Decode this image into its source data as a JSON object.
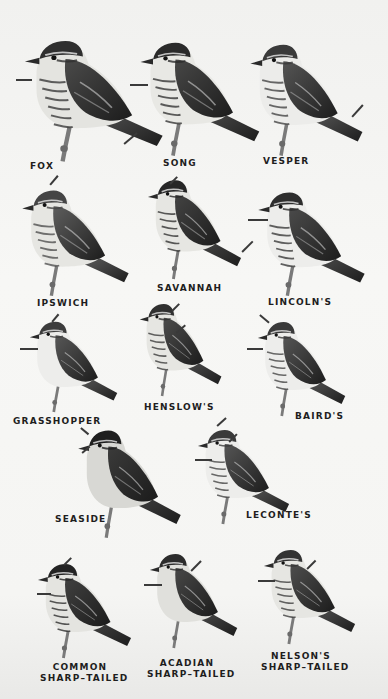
{
  "plate": {
    "background": "#f3f3f1",
    "ink": "#1e1e1e"
  },
  "birds": [
    {
      "id": "fox",
      "label": "FOX",
      "label_lines": [
        "FOX"
      ],
      "x": 22,
      "y": 36,
      "w": 145,
      "h": 128,
      "shade": "#2f2f2f",
      "belly": "#e4e4e0",
      "streaked": true
    },
    {
      "id": "song",
      "label": "SONG",
      "label_lines": [
        "SONG"
      ],
      "x": 138,
      "y": 38,
      "w": 125,
      "h": 120,
      "shade": "#2a2a2a",
      "belly": "#e8e8e4",
      "streaked": true
    },
    {
      "id": "vesper",
      "label": "VESPER",
      "label_lines": [
        "VESPER"
      ],
      "x": 248,
      "y": 40,
      "w": 118,
      "h": 118,
      "shade": "#3a3a3a",
      "belly": "#ececea",
      "streaked": true
    },
    {
      "id": "ipswich",
      "label": "IPSWICH",
      "label_lines": [
        "IPSWICH"
      ],
      "x": 20,
      "y": 186,
      "w": 112,
      "h": 112,
      "shade": "#454545",
      "belly": "#e6e6e2",
      "streaked": true
    },
    {
      "id": "savannah",
      "label": "SAVANNAH",
      "label_lines": [
        "SAVANNAH"
      ],
      "x": 146,
      "y": 176,
      "w": 98,
      "h": 105,
      "shade": "#262626",
      "belly": "#e6e6e2",
      "streaked": true
    },
    {
      "id": "lincolns",
      "label": "LINCOLN'S",
      "label_lines": [
        "LINCOLN'S"
      ],
      "x": 256,
      "y": 188,
      "w": 112,
      "h": 110,
      "shade": "#2e2e2e",
      "belly": "#ededeb",
      "streaked": true
    },
    {
      "id": "grasshopper",
      "label": "GRASSHOPPER",
      "label_lines": [
        "GRASSHOPPER"
      ],
      "x": 28,
      "y": 318,
      "w": 92,
      "h": 96,
      "shade": "#3c3c3c",
      "belly": "#ededeb",
      "streaked": false
    },
    {
      "id": "henslows",
      "label": "HENSLOW'S",
      "label_lines": [
        "HENSLOW'S"
      ],
      "x": 138,
      "y": 300,
      "w": 86,
      "h": 98,
      "shade": "#303030",
      "belly": "#e6e6e2",
      "streaked": true
    },
    {
      "id": "bairds",
      "label": "BAIRD'S",
      "label_lines": [
        "BAIRD'S"
      ],
      "x": 256,
      "y": 318,
      "w": 92,
      "h": 100,
      "shade": "#3a3a3a",
      "belly": "#ededeb",
      "streaked": true
    },
    {
      "id": "seaside",
      "label": "SEASIDE",
      "label_lines": [
        "SEASIDE"
      ],
      "x": 76,
      "y": 426,
      "w": 108,
      "h": 114,
      "shade": "#1f1f1f",
      "belly": "#d8d8d4",
      "streaked": false
    },
    {
      "id": "lecontes",
      "label": "LECONTE'S",
      "label_lines": [
        "LECONTE'S"
      ],
      "x": 196,
      "y": 426,
      "w": 96,
      "h": 100,
      "shade": "#3a3a3a",
      "belly": "#ededeb",
      "streaked": true
    },
    {
      "id": "common-sharp-tailed",
      "label": "COMMON SHARP-TAILED",
      "label_lines": [
        "COMMON",
        "SHARP–TAILED"
      ],
      "x": 36,
      "y": 560,
      "w": 98,
      "h": 100,
      "shade": "#232323",
      "belly": "#e4e4e0",
      "streaked": true
    },
    {
      "id": "acadian-sharp-tailed",
      "label": "ACADIAN SHARP-TAILED",
      "label_lines": [
        "ACADIAN",
        "SHARP–TAILED"
      ],
      "x": 148,
      "y": 550,
      "w": 92,
      "h": 100,
      "shade": "#2c2c2c",
      "belly": "#e0e0dc",
      "streaked": false
    },
    {
      "id": "nelsons-sharp-tailed",
      "label": "NELSON'S SHARP-TAILED",
      "label_lines": [
        "NELSON'S",
        "SHARP–TAILED"
      ],
      "x": 262,
      "y": 546,
      "w": 96,
      "h": 100,
      "shade": "#333333",
      "belly": "#e6e6e2",
      "streaked": true
    }
  ],
  "labels": {
    "fox": "FOX",
    "song": "SONG",
    "vesper": "VESPER",
    "ipswich": "IPSWICH",
    "savannah": "SAVANNAH",
    "lincolns": "LINCOLN'S",
    "grasshopper": "GRASSHOPPER",
    "henslows": "HENSLOW'S",
    "bairds": "BAIRD'S",
    "seaside": "SEASIDE",
    "lecontes": "LECONTE'S",
    "common_line1": "COMMON",
    "common_line2": "SHARP–TAILED",
    "acadian_line1": "ACADIAN",
    "acadian_line2": "SHARP–TAILED",
    "nelsons_line1": "NELSON'S",
    "nelsons_line2": "SHARP–TAILED"
  }
}
